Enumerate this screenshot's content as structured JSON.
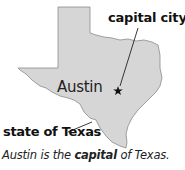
{
  "map": {
    "region": "state of Texas",
    "fill_color": "#d6d6d6",
    "outline_color": "#777777",
    "capital_marker": "star-icon"
  },
  "labels": {
    "capital_city": "capital city",
    "city": "Austin",
    "state": "state of Texas"
  },
  "caption": {
    "part1": "Austin is the ",
    "emphasis": "capital",
    "part2": " of Texas."
  }
}
